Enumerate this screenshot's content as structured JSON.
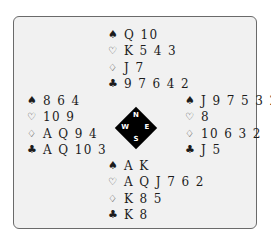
{
  "diagram": {
    "type": "bridge-deal",
    "compass": {
      "north": "N",
      "south": "S",
      "west": "W",
      "east": "E"
    },
    "suit_symbols": {
      "spades": "♠",
      "hearts": "♡",
      "diamonds": "♢",
      "clubs": "♣"
    },
    "hands": {
      "north": {
        "spades": "Q 10",
        "hearts": "K 5 4 3",
        "diamonds": "J 7",
        "clubs": "9 7 6 4 2"
      },
      "west": {
        "spades": "8 6 4",
        "hearts": "10 9",
        "diamonds": "A Q 9 4",
        "clubs": "A Q 10 3"
      },
      "east": {
        "spades": "J 9 7 5 3 2",
        "hearts": "8",
        "diamonds": "10 6 3 2",
        "clubs": "J 5"
      },
      "south": {
        "spades": "A K",
        "hearts": "A Q J 7 6 2",
        "diamonds": "K 8 5",
        "clubs": "K 8"
      }
    },
    "colors": {
      "background": "#f1f1f1",
      "border": "#6a6a6a",
      "text": "#1c1c1c",
      "compass_fill": "#000000",
      "compass_text": "#ffffff"
    }
  }
}
